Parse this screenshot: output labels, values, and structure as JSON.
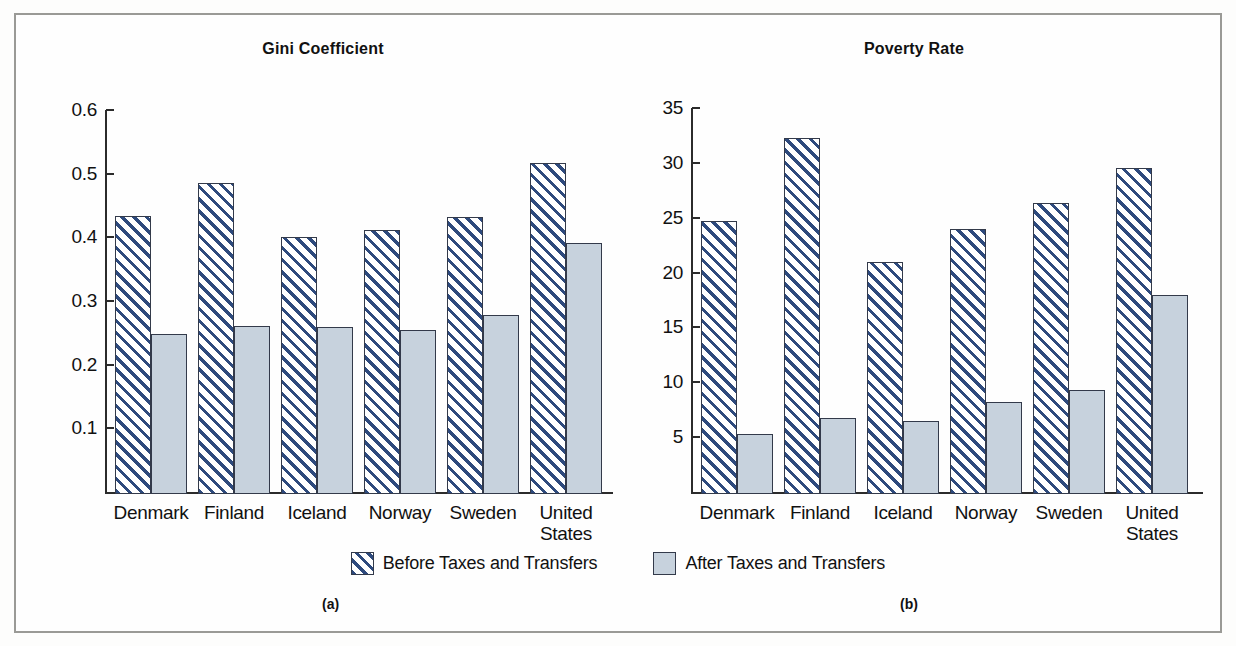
{
  "figure": {
    "panel_a_caption": "(a)",
    "panel_b_caption": "(b)",
    "legend": [
      {
        "label": "Before Taxes and Transfers",
        "swatch": "hatched-blue-diagonal",
        "color": "#2e4a7d"
      },
      {
        "label": "After Taxes and Transfers",
        "swatch": "solid-light-blue-gray",
        "color": "#c7d2dd"
      }
    ],
    "frame_color": "#9a9a96",
    "background_color": "#fefefe"
  },
  "chart_data": [
    {
      "type": "bar",
      "title": "Gini Coefficient",
      "panel": "(a)",
      "xlabel": "",
      "ylabel": "",
      "categories": [
        "Denmark",
        "Finland",
        "Iceland",
        "Norway",
        "Sweden",
        "United\nStates"
      ],
      "tick_labels": [
        "0.6",
        "0.5",
        "0.4",
        "0.3",
        "0.2",
        "0.1"
      ],
      "ticks": [
        0.6,
        0.5,
        0.4,
        0.3,
        0.2,
        0.1
      ],
      "ylim": [
        0,
        0.6
      ],
      "grid": false,
      "legend_position": "bottom-center",
      "series": [
        {
          "name": "Before Taxes and Transfers",
          "values": [
            0.433,
            0.486,
            0.401,
            0.412,
            0.432,
            0.516
          ]
        },
        {
          "name": "After Taxes and Transfers",
          "values": [
            0.248,
            0.261,
            0.259,
            0.254,
            0.278,
            0.391
          ]
        }
      ]
    },
    {
      "type": "bar",
      "title": "Poverty Rate",
      "panel": "(b)",
      "xlabel": "",
      "ylabel": "",
      "categories": [
        "Denmark",
        "Finland",
        "Iceland",
        "Norway",
        "Sweden",
        "United\nStates"
      ],
      "tick_labels": [
        "35",
        "30",
        "25",
        "20",
        "15",
        "10",
        "5"
      ],
      "ticks": [
        35,
        30,
        25,
        20,
        15,
        10,
        5
      ],
      "ylim": [
        0,
        35
      ],
      "grid": false,
      "legend_position": "bottom-center",
      "series": [
        {
          "name": "Before Taxes and Transfers",
          "values": [
            24.7,
            32.3,
            21.0,
            24.0,
            26.3,
            29.5
          ]
        },
        {
          "name": "After Taxes and Transfers",
          "values": [
            5.3,
            6.7,
            6.5,
            8.2,
            9.3,
            18.0
          ]
        }
      ]
    }
  ]
}
